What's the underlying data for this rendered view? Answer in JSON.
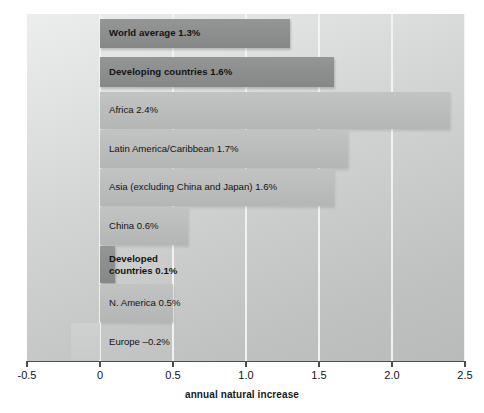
{
  "chart_data": {
    "type": "bar",
    "orientation": "horizontal",
    "title": "",
    "xlabel": "annual natural increase",
    "ylabel": "World regions",
    "xlim": [
      -0.5,
      2.5
    ],
    "xticks": [
      "-0.5",
      "0",
      "0.5",
      "1.0",
      "1.5",
      "2.0",
      "2.5"
    ],
    "xtick_values": [
      -0.5,
      0,
      0.5,
      1.0,
      1.5,
      2.0,
      2.5
    ],
    "grid": "vertical",
    "legend": "none",
    "categories": [
      "World average",
      "Developing countries",
      "Africa",
      "Latin America/Caribbean",
      "Asia (excluding China and Japan)",
      "China",
      "Developed countries",
      "N. America",
      "Europe"
    ],
    "values": [
      1.3,
      1.6,
      2.4,
      1.7,
      1.6,
      0.6,
      0.1,
      0.5,
      -0.2
    ],
    "bars": [
      {
        "label": "World average 1.3%",
        "label_lines": [
          "World average 1.3%"
        ],
        "value": 1.3,
        "style": "highlight",
        "emphasis": true,
        "gap_below": true,
        "label_inside": true
      },
      {
        "label": "Developing countries 1.6%",
        "label_lines": [
          "Developing countries 1.6%"
        ],
        "value": 1.6,
        "style": "highlight",
        "emphasis": true,
        "gap_below": true,
        "label_inside": true
      },
      {
        "label": "Africa 2.4%",
        "label_lines": [
          "Africa 2.4%"
        ],
        "value": 2.4,
        "style": "normal",
        "emphasis": false,
        "gap_below": false,
        "label_inside": true
      },
      {
        "label": "Latin America/Caribbean 1.7%",
        "label_lines": [
          "Latin America/Caribbean 1.7%"
        ],
        "value": 1.7,
        "style": "normal",
        "emphasis": false,
        "gap_below": false,
        "label_inside": true
      },
      {
        "label": "Asia (excluding China and Japan) 1.6%",
        "label_lines": [
          "Asia (excluding China and Japan) 1.6%"
        ],
        "value": 1.6,
        "style": "normal",
        "emphasis": false,
        "gap_below": false,
        "label_inside": true
      },
      {
        "label": "China 0.6%",
        "label_lines": [
          "China 0.6%"
        ],
        "value": 0.6,
        "style": "normal",
        "emphasis": false,
        "gap_below": false,
        "label_inside": true
      },
      {
        "label": "Developed countries 0.1%",
        "label_lines": [
          "Developed",
          "countries 0.1%"
        ],
        "value": 0.1,
        "style": "highlight",
        "emphasis": true,
        "gap_below": false,
        "label_inside": false
      },
      {
        "label": "N. America 0.5%",
        "label_lines": [
          "N. America 0.5%"
        ],
        "value": 0.5,
        "style": "normal",
        "emphasis": false,
        "gap_below": false,
        "label_inside": true
      },
      {
        "label": "Europe  -0.2%",
        "label_lines": [
          "Europe  –0.2%"
        ],
        "value": -0.2,
        "style": "normal",
        "emphasis": false,
        "gap_below": false,
        "label_inside": false
      }
    ],
    "colors": {
      "bar_highlight": "#8d8e8e",
      "bar_normal": "#bbbcbc",
      "bar_negative": "#c9caca",
      "plot_background": "#d0d1d1",
      "gridline": "#f4f5f5",
      "axis": "#4d4d4d",
      "text": "#131313",
      "page_background": "#ffffff"
    }
  }
}
